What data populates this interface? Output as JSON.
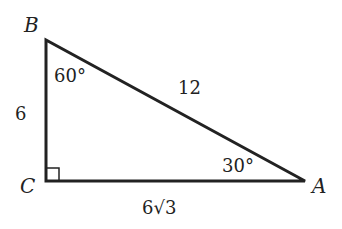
{
  "diagram": {
    "type": "right-triangle",
    "vertices": {
      "B": {
        "label": "B"
      },
      "C": {
        "label": "C"
      },
      "A": {
        "label": "A"
      }
    },
    "angles": {
      "B": "60°",
      "A": "30°",
      "C": "right-angle"
    },
    "sides": {
      "BC": "6",
      "AB": "12",
      "CA": "6√3"
    },
    "colors": {
      "stroke": "#222222",
      "background": "#ffffff"
    }
  }
}
